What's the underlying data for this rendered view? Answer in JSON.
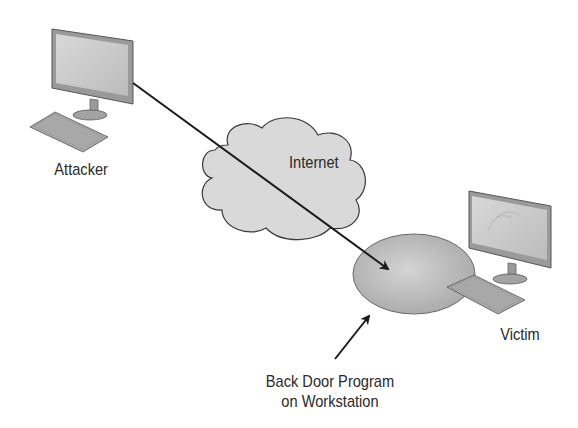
{
  "diagram": {
    "nodes": {
      "attacker": {
        "label": "Attacker",
        "icon": "desktop-computer-icon"
      },
      "internet": {
        "label": "Internet",
        "icon": "cloud-icon"
      },
      "victim": {
        "label": "Victim",
        "icon": "desktop-computer-icon"
      },
      "backdoor": {
        "label_line1": "Back Door Program",
        "label_line2": "on Workstation",
        "shape": "ellipse"
      }
    },
    "edges": [
      {
        "from": "attacker",
        "to": "backdoor",
        "via": "internet",
        "style": "arrow"
      },
      {
        "from": "backdoor-label",
        "to": "backdoor",
        "style": "pointer-arrow"
      }
    ],
    "colors": {
      "line": "#1a1a1a",
      "cloud_fill": "#d9d9d9",
      "ellipse_fill": "#bdbdbd",
      "monitor_frame": "#8c8c8c",
      "screen": "#cfcfcf",
      "text": "#2a2a2a"
    }
  }
}
